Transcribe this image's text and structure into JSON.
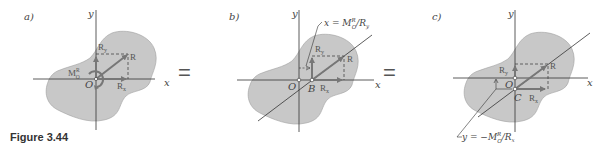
{
  "figure": {
    "caption": "Figure 3.44",
    "equals": "=",
    "colors": {
      "blob": "#c8c8c8",
      "blob_stroke": "#9a9a9a",
      "axis": "#333333",
      "vector": "#777777"
    },
    "panels": [
      {
        "id": "a",
        "label": "a)",
        "x_axis": "x",
        "y_axis": "y",
        "origin": "O",
        "vectors": {
          "R": "R",
          "Rx": "R",
          "Rx_sub": "x",
          "Ry": "R",
          "Ry_sub": "y"
        },
        "moment": {
          "M": "M",
          "sup": "R",
          "sub": "O"
        }
      },
      {
        "id": "b",
        "label": "b)",
        "x_axis": "x",
        "y_axis": "y",
        "origin": "O",
        "point": "B",
        "vectors": {
          "R": "R",
          "Rx": "R",
          "Rx_sub": "x",
          "Ry": "R",
          "Ry_sub": "y"
        },
        "annotation": "x = M_O^R/R_y",
        "annotation_parts": {
          "lhs": "x = M",
          "sup": "R",
          "sub": "O",
          "rhs": "/R",
          "rhs_sub": "y"
        }
      },
      {
        "id": "c",
        "label": "c)",
        "x_axis": "x",
        "y_axis": "y",
        "origin": "O",
        "point": "C",
        "vectors": {
          "R": "R",
          "Rx": "R",
          "Rx_sub": "x",
          "Ry": "R",
          "Ry_sub": "y"
        },
        "annotation": "y = −M_O^R/R_x",
        "annotation_parts": {
          "lhs": "y = −M",
          "sup": "R",
          "sub": "O",
          "rhs": "/R",
          "rhs_sub": "x"
        }
      }
    ]
  }
}
